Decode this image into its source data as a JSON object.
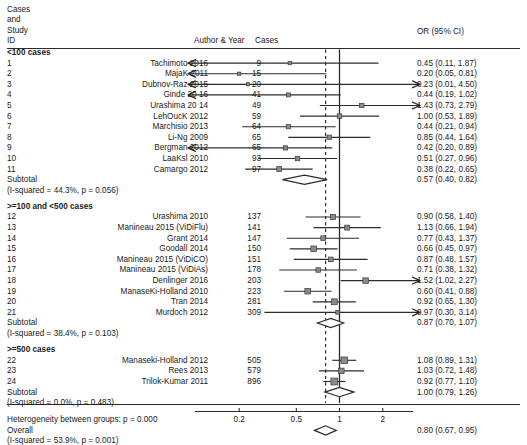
{
  "header": {
    "col_study_id": "Cases\nand\nStudy\nID",
    "col_study_id_lines": [
      "Cases",
      "and",
      "Study",
      "ID"
    ],
    "col_author_year": "Author & Year",
    "col_cases": "Cases",
    "col_or": "OR (95% CI)"
  },
  "footer": {
    "heterogeneity_between": "Heterogeneity between groups: p = 0.000",
    "overall_label": "Overall",
    "overall_stats": "(I-squared = 53.9%, p = 0.001)",
    "overall_or": "0.80 (0.67, 0.95)"
  },
  "axis": {
    "ticks": [
      {
        "label": "0.2",
        "value": 0.2
      },
      {
        "label": "0.5",
        "value": 0.5
      },
      {
        "label": "1",
        "value": 1
      },
      {
        "label": "2",
        "value": 2
      }
    ]
  },
  "chart_data": {
    "type": "forest",
    "title": "",
    "xlabel": "",
    "ylabel": "",
    "effect_measure": "OR (95% CI)",
    "xscale": "log",
    "xlim": [
      0.1,
      3.2
    ],
    "null_line": 1,
    "overall_line": 0.8,
    "overall": {
      "or": 0.8,
      "lcl": 0.67,
      "ucl": 0.95,
      "label": "0.80 (0.67, 0.95)",
      "i_squared": "53.9%",
      "p": "0.001"
    },
    "heterogeneity_between_groups_p": "0.000",
    "groups": [
      {
        "name": "<100 cases",
        "subtotal_label": "Subtotal",
        "subtotal_stats": "(I-squared = 44.3%, p = 0.056)",
        "subtotal": {
          "or": 0.57,
          "lcl": 0.4,
          "ucl": 0.82,
          "label": "0.57 (0.40, 0.82)"
        },
        "studies": [
          {
            "id": "1",
            "author": "Tachimoto 2016",
            "cases": "9",
            "or": 0.45,
            "lcl": 0.11,
            "ucl": 1.87,
            "label": "0.45 (0.11, 1.87)",
            "weight": 1.8,
            "arrow_left": true,
            "arrow_right": false
          },
          {
            "id": "2",
            "author": "MajaK 2011",
            "cases": "15",
            "or": 0.2,
            "lcl": 0.05,
            "ucl": 0.81,
            "label": "0.20 (0.05, 0.81)",
            "weight": 1.6,
            "arrow_left": true,
            "arrow_right": false
          },
          {
            "id": "3",
            "author": "Dubnov-Raz 2015",
            "cases": "20",
            "or": 0.23,
            "lcl": 0.01,
            "ucl": 4.5,
            "label": "0.23 (0.01, 4.50)",
            "weight": 1.2,
            "arrow_left": true,
            "arrow_right": true
          },
          {
            "id": "4",
            "author": "Ginde 20 16",
            "cases": "41",
            "or": 0.44,
            "lcl": 0.19,
            "ucl": 1.02,
            "label": "0.44 (0.19, 1.02)",
            "weight": 2.6,
            "arrow_left": true,
            "arrow_right": false
          },
          {
            "id": "5",
            "author": "Urashima 20 14",
            "cases": "49",
            "or": 1.43,
            "lcl": 0.73,
            "ucl": 2.79,
            "label": "1.43 (0.73, 2.79)",
            "weight": 3.2,
            "arrow_left": false,
            "arrow_right": true
          },
          {
            "id": "6",
            "author": "LehOucK 2012",
            "cases": "59",
            "or": 1.0,
            "lcl": 0.53,
            "ucl": 1.89,
            "label": "1.00 (0.53, 1.89)",
            "weight": 3.4,
            "arrow_left": false,
            "arrow_right": false
          },
          {
            "id": "7",
            "author": "Marchisio 2013",
            "cases": "64",
            "or": 0.44,
            "lcl": 0.21,
            "ucl": 0.94,
            "label": "0.44 (0.21, 0.94)",
            "weight": 3.0,
            "arrow_left": false,
            "arrow_right": false
          },
          {
            "id": "8",
            "author": "Li-Ng 2009",
            "cases": "65",
            "or": 0.85,
            "lcl": 0.44,
            "ucl": 1.64,
            "label": "0.85 (0.44, 1.64)",
            "weight": 3.2,
            "arrow_left": false,
            "arrow_right": false
          },
          {
            "id": "9",
            "author": "Bergman 2012",
            "cases": "65",
            "or": 0.42,
            "lcl": 0.2,
            "ucl": 0.89,
            "label": "0.42 (0.20, 0.89)",
            "weight": 3.0,
            "arrow_left": true,
            "arrow_right": false
          },
          {
            "id": "10",
            "author": "LaaKsl 2010",
            "cases": "93",
            "or": 0.51,
            "lcl": 0.27,
            "ucl": 0.96,
            "label": "0.51 (0.27, 0.96)",
            "weight": 3.4,
            "arrow_left": false,
            "arrow_right": false
          },
          {
            "id": "11",
            "author": "Camargo 2012",
            "cases": "97",
            "or": 0.38,
            "lcl": 0.22,
            "ucl": 0.65,
            "label": "0.38 (0.22, 0.65)",
            "weight": 4.0,
            "arrow_left": false,
            "arrow_right": false
          }
        ]
      },
      {
        "name": ">=100 and <500 cases",
        "subtotal_label": "Subtotal",
        "subtotal_stats": "(I-squared = 38.4%, p = 0.103)",
        "subtotal": {
          "or": 0.87,
          "lcl": 0.7,
          "ucl": 1.07,
          "label": "0.87 (0.70, 1.07)"
        },
        "studies": [
          {
            "id": "12",
            "author": "Urashima 2010",
            "cases": "137",
            "or": 0.9,
            "lcl": 0.58,
            "ucl": 1.4,
            "label": "0.90 (0.58, 1.40)",
            "weight": 4.6,
            "arrow_left": false,
            "arrow_right": false
          },
          {
            "id": "13",
            "author": "Manineau 2015 (ViDiFlu)",
            "cases": "141",
            "or": 1.13,
            "lcl": 0.66,
            "ucl": 1.94,
            "label": "1.13 (0.66, 1.94)",
            "weight": 4.0,
            "arrow_left": false,
            "arrow_right": false
          },
          {
            "id": "14",
            "author": "Grant 2014",
            "cases": "147",
            "or": 0.77,
            "lcl": 0.43,
            "ucl": 1.37,
            "label": "0.77 (0.43, 1.37)",
            "weight": 3.8,
            "arrow_left": false,
            "arrow_right": false
          },
          {
            "id": "15",
            "author": "Goodall 2014",
            "cases": "150",
            "or": 0.66,
            "lcl": 0.45,
            "ucl": 0.97,
            "label": "0.66 (0.45, 0.97)",
            "weight": 5.2,
            "arrow_left": false,
            "arrow_right": false
          },
          {
            "id": "16",
            "author": "Manineau 2015 (ViDiCO)",
            "cases": "151",
            "or": 0.87,
            "lcl": 0.48,
            "ucl": 1.57,
            "label": "0.87 (0.48, 1.57)",
            "weight": 3.6,
            "arrow_left": false,
            "arrow_right": false
          },
          {
            "id": "17",
            "author": "Manineau 2015 (ViDiAs)",
            "cases": "178",
            "or": 0.71,
            "lcl": 0.38,
            "ucl": 1.32,
            "label": "0.71 (0.38, 1.32)",
            "weight": 3.4,
            "arrow_left": false,
            "arrow_right": false
          },
          {
            "id": "18",
            "author": "Denlinger 2016",
            "cases": "203",
            "or": 1.52,
            "lcl": 1.02,
            "ucl": 2.27,
            "label": "1.52 (1.02, 2.27)",
            "weight": 5.0,
            "arrow_left": false,
            "arrow_right": true
          },
          {
            "id": "19",
            "author": "ManaseKi-Holland 2010",
            "cases": "223",
            "or": 0.6,
            "lcl": 0.41,
            "ucl": 0.88,
            "label": "0.60 (0.41, 0.88)",
            "weight": 5.2,
            "arrow_left": false,
            "arrow_right": false
          },
          {
            "id": "20",
            "author": "Tran 2014",
            "cases": "281",
            "or": 0.92,
            "lcl": 0.65,
            "ucl": 1.3,
            "label": "0.92 (0.65, 1.30)",
            "weight": 5.6,
            "arrow_left": false,
            "arrow_right": false
          },
          {
            "id": "21",
            "author": "Murdoch 2012",
            "cases": "309",
            "or": 0.97,
            "lcl": 0.3,
            "ucl": 3.14,
            "label": "0.97 (0.30, 3.14)",
            "weight": 2.2,
            "arrow_left": false,
            "arrow_right": true
          }
        ]
      },
      {
        "name": ">=500 cases",
        "subtotal_label": "Subtotal",
        "subtotal_stats": "(I-squared = 0.0%, p = 0.483)",
        "subtotal": {
          "or": 1.0,
          "lcl": 0.79,
          "ucl": 1.26,
          "label": "1.00 (0.79, 1.26)"
        },
        "studies": [
          {
            "id": "22",
            "author": "Manaseki-Holland 2012",
            "cases": "505",
            "or": 1.08,
            "lcl": 0.89,
            "ucl": 1.31,
            "label": "1.08 (0.89, 1.31)",
            "weight": 7.4,
            "arrow_left": false,
            "arrow_right": false
          },
          {
            "id": "23",
            "author": "Rees 2013",
            "cases": "579",
            "or": 1.03,
            "lcl": 0.72,
            "ucl": 1.48,
            "label": "1.03 (0.72, 1.48)",
            "weight": 5.0,
            "arrow_left": false,
            "arrow_right": false
          },
          {
            "id": "24",
            "author": "Trilok-Kumar 2011",
            "cases": "896",
            "or": 0.92,
            "lcl": 0.77,
            "ucl": 1.1,
            "label": "0.92 (0.77, 1.10)",
            "weight": 7.8,
            "arrow_left": false,
            "arrow_right": false
          }
        ]
      }
    ]
  },
  "colors": {
    "line": "#2b2b2b",
    "marker": "#8a8a8a",
    "marker_border": "#3a3a3a",
    "text": "#1a1a1a",
    "null_line": "#2b2b2b",
    "summary_line": "#2b2b2b"
  }
}
